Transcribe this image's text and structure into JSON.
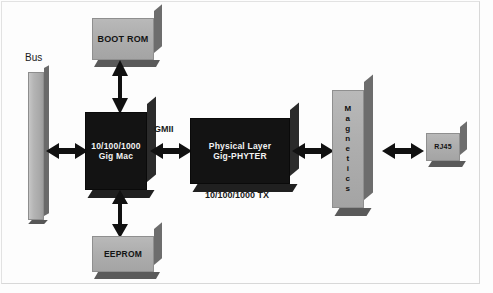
{
  "diagram": {
    "background_color": "#fdfdfd",
    "block_gray_color": "#b0b0b0",
    "block_black_color": "#131313",
    "arrow_color": "#111111"
  },
  "blocks": {
    "bus": {
      "label": "Bus",
      "kind": "bar-gray"
    },
    "boot_rom": {
      "label": "BOOT ROM",
      "kind": "block-gray"
    },
    "eeprom": {
      "label": "EEPROM",
      "kind": "block-gray"
    },
    "gig_mac": {
      "line1": "10/100/1000",
      "line2": "Gig Mac",
      "kind": "block-black"
    },
    "phyter": {
      "line1": "Physical Layer",
      "line2": "Gig-PHYTER",
      "kind": "block-black"
    },
    "magnetics": {
      "label": "Magnetics",
      "letters": [
        "M",
        "a",
        "g",
        "n",
        "e",
        "t",
        "i",
        "c",
        "s"
      ],
      "kind": "block-gray"
    },
    "rj45": {
      "label": "RJ45",
      "kind": "block-gray"
    }
  },
  "connections": {
    "gmii_label": "GMII",
    "tx_label": "10/100/1000 TX",
    "bus_to_mac": "bidirectional",
    "bootrom_to_mac": "bidirectional",
    "eeprom_to_mac": "bidirectional",
    "mac_to_phy": "bidirectional",
    "phy_to_magnetics": "bidirectional",
    "magnetics_to_rj45": "bidirectional"
  }
}
